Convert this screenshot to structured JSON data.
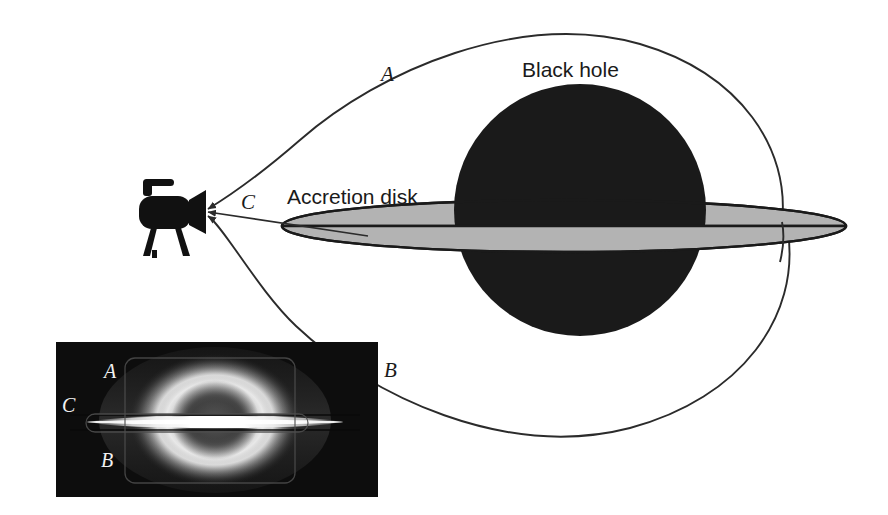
{
  "figure": {
    "background_color": "#ffffff",
    "width": 888,
    "height": 515
  },
  "diagram": {
    "labels": {
      "black_hole": "Black hole",
      "accretion_disk": "Accretion disk",
      "ray_a": "A",
      "ray_b": "B",
      "ray_c": "C"
    },
    "colors": {
      "black_hole_fill": "#1a1a1a",
      "disk_fill": "#b3b3b3",
      "disk_stroke": "#1a1a1a",
      "ray_stroke": "#2b2b2b",
      "camera_fill": "#111111",
      "text": "#1a1a1a"
    },
    "camera": {
      "name": "observer camera",
      "lens_x": 200,
      "lens_y": 212
    },
    "black_hole": {
      "center_x": 580,
      "center_y": 210,
      "radius": 126
    },
    "accretion_disk": {
      "center_x": 564,
      "center_y": 226,
      "radius_x": 282,
      "radius_y": 26
    },
    "rays": [
      {
        "id": "A",
        "description": "upper light path bending over the black hole to the far side of the disk"
      },
      {
        "id": "B",
        "description": "lower light path bending under the black hole to the far side of the disk"
      },
      {
        "id": "C",
        "description": "direct light path from the near edge of the accretion disk"
      }
    ]
  },
  "inset": {
    "caption": "Simulated image of the black hole as seen by the camera",
    "labels": {
      "ray_a": "A",
      "ray_b": "B",
      "ray_c": "C"
    },
    "colors": {
      "background": "#0d0d0d",
      "glow": "#f5f5f5",
      "label_text": "#f2f2f2",
      "outline": "#4d4d4d"
    },
    "bounds": {
      "x": 56,
      "y": 342,
      "width": 322,
      "height": 155
    }
  }
}
